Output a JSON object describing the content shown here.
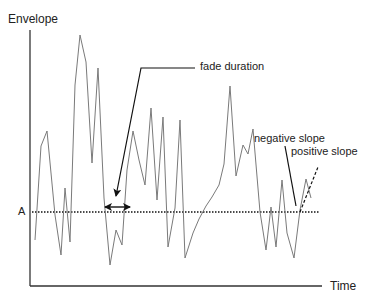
{
  "diagram": {
    "title": "",
    "y_axis_label": "Envelope",
    "x_axis_label": "Time",
    "threshold_label": "A",
    "annotations": {
      "fade_duration": "fade duration",
      "negative_slope": "negative slope",
      "positive_slope": "positive slope"
    },
    "colors": {
      "signal": "#7a7a7a",
      "axes": "#333333",
      "threshold": "#111111",
      "arrows": "#111111"
    }
  },
  "chart_data": {
    "type": "line",
    "title": "",
    "xlabel": "Time",
    "ylabel": "Envelope",
    "threshold": {
      "label": "A",
      "style": "dotted"
    },
    "series": [
      {
        "name": "envelope",
        "points": [
          [
            35,
            240
          ],
          [
            41,
            146
          ],
          [
            47,
            131
          ],
          [
            55,
            215
          ],
          [
            61,
            255
          ],
          [
            65,
            188
          ],
          [
            70,
            242
          ],
          [
            75,
            85
          ],
          [
            80,
            35
          ],
          [
            86,
            62
          ],
          [
            92,
            163
          ],
          [
            98,
            68
          ],
          [
            104,
            198
          ],
          [
            110,
            265
          ],
          [
            116,
            230
          ],
          [
            122,
            245
          ],
          [
            127,
            170
          ],
          [
            133,
            131
          ],
          [
            139,
            160
          ],
          [
            145,
            185
          ],
          [
            151,
            108
          ],
          [
            157,
            200
          ],
          [
            163,
            117
          ],
          [
            168,
            247
          ],
          [
            175,
            208
          ],
          [
            180,
            120
          ],
          [
            185,
            258
          ],
          [
            193,
            233
          ],
          [
            199,
            219
          ],
          [
            206,
            206
          ],
          [
            212,
            197
          ],
          [
            219,
            185
          ],
          [
            224,
            164
          ],
          [
            230,
            86
          ],
          [
            236,
            176
          ],
          [
            243,
            145
          ],
          [
            248,
            154
          ],
          [
            253,
            129
          ],
          [
            260,
            212
          ],
          [
            266,
            250
          ],
          [
            271,
            207
          ],
          [
            276,
            247
          ],
          [
            282,
            180
          ],
          [
            287,
            233
          ],
          [
            294,
            258
          ],
          [
            300,
            210
          ],
          [
            306,
            179
          ],
          [
            311,
            198
          ]
        ]
      }
    ],
    "annotations": [
      "fade duration",
      "negative slope",
      "positive slope"
    ],
    "grid": false
  }
}
